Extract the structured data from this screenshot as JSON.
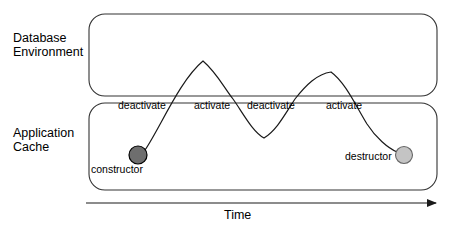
{
  "diagram": {
    "lanes": [
      {
        "id": "database-environment",
        "label": "Database\nEnvironment"
      },
      {
        "id": "application-cache",
        "label": "Application\nCache"
      }
    ],
    "state_transitions": [
      {
        "label": "deactivate",
        "x": 118,
        "y": 99
      },
      {
        "label": "activate",
        "x": 194,
        "y": 99
      },
      {
        "label": "deactivate",
        "x": 247,
        "y": 99
      },
      {
        "label": "activate",
        "x": 326,
        "y": 99
      }
    ],
    "nodes": [
      {
        "id": "constructor",
        "label": "constructor",
        "label_x": 91,
        "label_y": 163,
        "cx": 138,
        "cy": 155,
        "r": 9,
        "fill": "#6e6e6e",
        "stroke": "#000000"
      },
      {
        "id": "destructor",
        "label": "destructor",
        "label_x": 345,
        "label_y": 150,
        "cx": 404,
        "cy": 155,
        "r": 8.5,
        "fill": "#c4c4c4",
        "stroke": "#555555"
      }
    ],
    "axis": {
      "label": "Time",
      "x_start": 86,
      "x_end": 441,
      "y": 203
    },
    "colors": {
      "stroke": "#1a1a1a",
      "lane_border": "#333333",
      "background": "#ffffff",
      "constructor_fill": "#6e6e6e",
      "destructor_fill": "#c4c4c4"
    },
    "lane_boxes": [
      {
        "id": "database-environment-box",
        "x": 89,
        "y": 14,
        "w": 348,
        "h": 82,
        "radius": 16
      },
      {
        "id": "application-cache-box",
        "x": 89,
        "y": 103,
        "w": 348,
        "h": 87,
        "radius": 16
      }
    ],
    "lifecycle_path": "M 145 150 L 203 61 L 233 99 L 264 138 L 295 99 L 331 72 L 367 124 L 397 152"
  }
}
